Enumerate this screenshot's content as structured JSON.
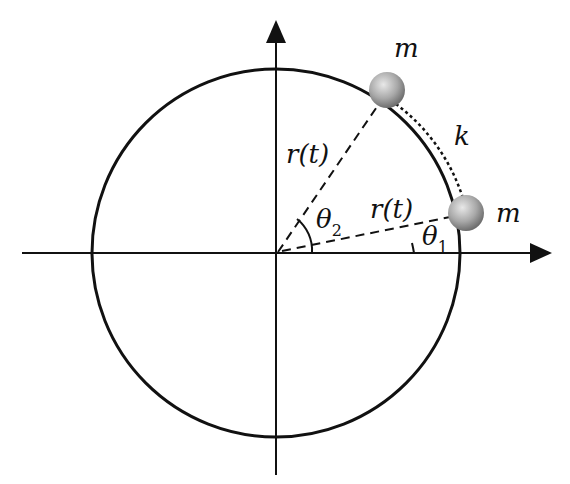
{
  "diagram": {
    "labels": {
      "mass_top": "m",
      "mass_right": "m",
      "spring": "k",
      "radius_upper": "r(t)",
      "radius_lower": "r(t)",
      "theta2": "θ",
      "theta2_sub": "2",
      "theta1": "θ",
      "theta1_sub": "1"
    },
    "colors": {
      "line": "#111111",
      "mass": "#a0a0a0",
      "background": "#ffffff"
    }
  }
}
